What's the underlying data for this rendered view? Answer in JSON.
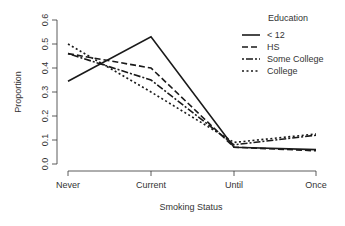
{
  "chart_data": {
    "type": "line",
    "title": "",
    "xlabel": "Smoking Status",
    "ylabel": "Proportion",
    "categories": [
      "Never",
      "Current",
      "Until",
      "Once"
    ],
    "ylim": [
      0.0,
      0.6
    ],
    "yticks": [
      "0.0",
      "0.1",
      "0.2",
      "0.3",
      "0.4",
      "0.5",
      "0.6"
    ],
    "grid": false,
    "legend": {
      "title": "Education",
      "position": "top-right"
    },
    "series": [
      {
        "name": "< 12",
        "style": "solid",
        "values": [
          0.345,
          0.53,
          0.07,
          0.06
        ]
      },
      {
        "name": "HS",
        "style": "dashed",
        "values": [
          0.46,
          0.4,
          0.07,
          0.055
        ]
      },
      {
        "name": "Some College",
        "style": "longdash",
        "values": [
          0.46,
          0.35,
          0.08,
          0.12
        ]
      },
      {
        "name": "College",
        "style": "dotted",
        "values": [
          0.5,
          0.3,
          0.09,
          0.125
        ]
      }
    ]
  },
  "colors": {
    "line": "#1a1a1a",
    "axis": "#333333"
  }
}
